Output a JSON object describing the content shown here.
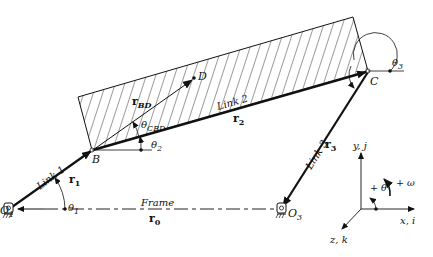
{
  "diagram": {
    "points": {
      "O1": {
        "label": "O",
        "sub": "1"
      },
      "B": {
        "label": "B"
      },
      "C": {
        "label": "C"
      },
      "D": {
        "label": "D"
      },
      "O3": {
        "label": "O",
        "sub": "3"
      }
    },
    "links": {
      "link1": {
        "name": "Link 1",
        "vector": "r",
        "vector_sub": "1"
      },
      "link2": {
        "name": "Link 2",
        "vector": "r",
        "vector_sub": "2"
      },
      "link3": {
        "name": "Link 3",
        "vector": "r",
        "vector_sub": "3"
      },
      "frame": {
        "name": "Frame",
        "vector": "r",
        "vector_sub": "0"
      }
    },
    "vectors": {
      "rBD": {
        "label": "r",
        "sub": "BD"
      }
    },
    "angles": {
      "theta1": {
        "label": "θ",
        "sub": "1"
      },
      "theta2": {
        "label": "θ",
        "sub": "2"
      },
      "theta3": {
        "label": "θ",
        "sub": "3"
      },
      "thetaCBD": {
        "label": "θ",
        "sub": "CBD"
      }
    },
    "axes": {
      "y": "y, j",
      "x": "x, i",
      "z": "z, k",
      "theta_positive": "+ θ",
      "omega_positive": "+ ω"
    }
  }
}
